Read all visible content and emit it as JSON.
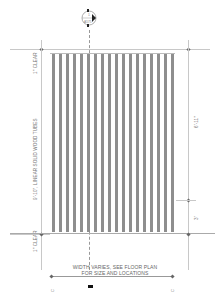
{
  "section_marker": {
    "top": "1",
    "bottom": "A575",
    "icon": "section-cut-marker-icon"
  },
  "dimensions": {
    "left_top_clear": "1\" CLEAR",
    "left_overall": "9'-10\", LINEAR SOLID WOOD TUBES",
    "left_bottom_clear": "1\" CLEAR",
    "right_upper": "6'-11\"",
    "right_lower": "3'"
  },
  "notes": {
    "width_line1": "WIDTH VARIES, SEE FLOOR PLAN",
    "width_line2": "FOR SIZE AND LOCATIONS"
  },
  "grid_labels": {
    "left": "C",
    "right": "C"
  },
  "tubes": {
    "count": 18,
    "color": "#8e8e8e"
  }
}
